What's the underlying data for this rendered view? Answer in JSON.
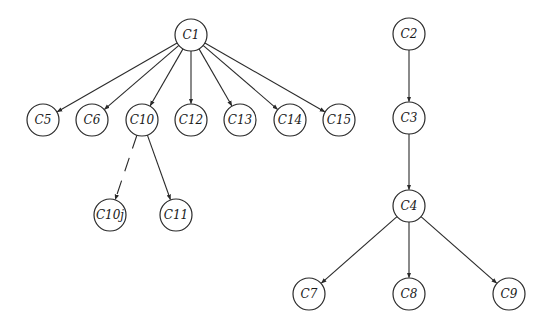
{
  "diagram": {
    "title": "",
    "type": "tree",
    "node_radius": 16,
    "colors": {
      "stroke": "#2a2a2a",
      "fill": "#ffffff",
      "text": "#1a1a1a",
      "background": "#ffffff"
    },
    "nodes": [
      {
        "id": "C1",
        "label": "C1",
        "x": 191,
        "y": 35
      },
      {
        "id": "C5",
        "label": "C5",
        "x": 43,
        "y": 120
      },
      {
        "id": "C6",
        "label": "C6",
        "x": 92,
        "y": 120
      },
      {
        "id": "C10",
        "label": "C10",
        "x": 142,
        "y": 120
      },
      {
        "id": "C12",
        "label": "C12",
        "x": 191,
        "y": 120
      },
      {
        "id": "C13",
        "label": "C13",
        "x": 240,
        "y": 120
      },
      {
        "id": "C14",
        "label": "C14",
        "x": 290,
        "y": 120
      },
      {
        "id": "C15",
        "label": "C15",
        "x": 339,
        "y": 120
      },
      {
        "id": "C10j",
        "label": "C10j",
        "x": 110,
        "y": 215
      },
      {
        "id": "C11",
        "label": "C11",
        "x": 176,
        "y": 215
      },
      {
        "id": "C2",
        "label": "C2",
        "x": 409,
        "y": 34
      },
      {
        "id": "C3",
        "label": "C3",
        "x": 409,
        "y": 118
      },
      {
        "id": "C4",
        "label": "C4",
        "x": 409,
        "y": 206
      },
      {
        "id": "C7",
        "label": "C7",
        "x": 309,
        "y": 294
      },
      {
        "id": "C8",
        "label": "C8",
        "x": 409,
        "y": 294
      },
      {
        "id": "C9",
        "label": "C9",
        "x": 509,
        "y": 294
      }
    ],
    "edges": [
      {
        "from": "C1",
        "to": "C5",
        "style": "solid"
      },
      {
        "from": "C1",
        "to": "C6",
        "style": "solid"
      },
      {
        "from": "C1",
        "to": "C10",
        "style": "solid"
      },
      {
        "from": "C1",
        "to": "C12",
        "style": "solid"
      },
      {
        "from": "C1",
        "to": "C13",
        "style": "solid"
      },
      {
        "from": "C1",
        "to": "C14",
        "style": "solid"
      },
      {
        "from": "C1",
        "to": "C15",
        "style": "solid"
      },
      {
        "from": "C10",
        "to": "C10j",
        "style": "dashed"
      },
      {
        "from": "C10",
        "to": "C11",
        "style": "solid"
      },
      {
        "from": "C2",
        "to": "C3",
        "style": "solid"
      },
      {
        "from": "C3",
        "to": "C4",
        "style": "solid"
      },
      {
        "from": "C4",
        "to": "C7",
        "style": "solid"
      },
      {
        "from": "C4",
        "to": "C8",
        "style": "solid"
      },
      {
        "from": "C4",
        "to": "C9",
        "style": "solid"
      }
    ]
  }
}
